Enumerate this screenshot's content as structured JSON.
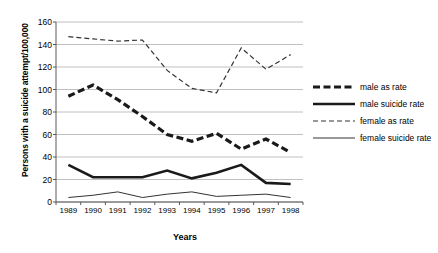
{
  "chart_data": {
    "type": "line",
    "title": "",
    "xlabel": "Years",
    "ylabel": "Persons with a suicide attempt/100,000",
    "categories": [
      "1989",
      "1990",
      "1991",
      "1992",
      "1993",
      "1994",
      "1995",
      "1996",
      "1997",
      "1998"
    ],
    "x": [
      1989,
      1990,
      1991,
      1992,
      1993,
      1994,
      1995,
      1996,
      1997,
      1998
    ],
    "ylim": [
      0,
      160
    ],
    "yticks": [
      0,
      20,
      40,
      60,
      80,
      100,
      120,
      140,
      160
    ],
    "ytick_labels": [
      "0",
      "20",
      "40",
      "60",
      "80",
      "100",
      "120",
      "140",
      "160"
    ],
    "grid": "horizontal",
    "legend_position": "right",
    "series": [
      {
        "name": "male as rate",
        "style": "dashed-thick",
        "color": "#1a1a1a",
        "values": [
          94,
          104,
          91,
          76,
          60,
          54,
          61,
          47,
          56,
          44
        ]
      },
      {
        "name": "male suicide rate",
        "style": "solid-thick",
        "color": "#1a1a1a",
        "values": [
          33,
          22,
          22,
          22,
          28,
          21,
          26,
          33,
          17,
          16
        ]
      },
      {
        "name": "female as rate",
        "style": "dashed-thin",
        "color": "#333333",
        "values": [
          147,
          145,
          143,
          144,
          117,
          101,
          97,
          137,
          118,
          131
        ]
      },
      {
        "name": "female suicide rate",
        "style": "solid-thin",
        "color": "#333333",
        "values": [
          4,
          6,
          9,
          4,
          7,
          9,
          5,
          6,
          7,
          4
        ]
      }
    ]
  },
  "legend": {
    "items": [
      {
        "label": "male as rate"
      },
      {
        "label": "male suicide rate"
      },
      {
        "label": "female as rate"
      },
      {
        "label": "female suicide rate"
      }
    ]
  }
}
